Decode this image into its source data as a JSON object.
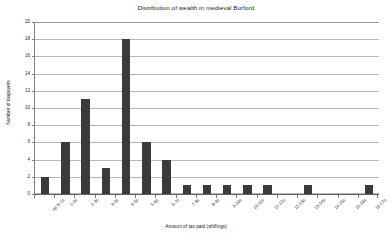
{
  "chart_data": {
    "type": "bar",
    "title": "Distribution of wealth in medieval Burford",
    "xlabel": "Amount of tax paid (shillings)",
    "ylabel": "Number of taxpayers",
    "categories": [
      "up to 1s",
      "1-2s",
      "2-3s",
      "3-4s",
      "4-5s",
      "5-6s",
      "6-7s",
      "7-8s",
      "8-9s",
      "9-10s",
      "10-11s",
      "11-12s",
      "12-13s",
      "13-14s",
      "14-15s",
      "15-16s",
      "16-17s"
    ],
    "values": [
      2,
      6,
      11,
      3,
      18,
      6,
      4,
      1,
      1,
      1,
      1,
      1,
      0,
      1,
      0,
      0,
      1
    ],
    "ylim": [
      0,
      20
    ],
    "ytick_values": [
      0,
      2,
      4,
      6,
      8,
      10,
      12,
      14,
      16,
      18,
      20
    ],
    "ytick_labels": [
      "0",
      "2",
      "4",
      "6",
      "8",
      "10",
      "12",
      "14",
      "16",
      "18",
      "20"
    ],
    "grid": true,
    "legend": false,
    "bar_color": "#3b3b3b",
    "grid_color": "#b8b8b8",
    "axis_color": "#808080",
    "background_color": "#ffffff"
  }
}
